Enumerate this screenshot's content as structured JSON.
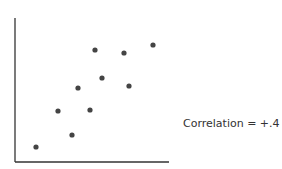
{
  "chart_data": {
    "type": "scatter",
    "title": "",
    "xlabel": "",
    "ylabel": "",
    "grid": false,
    "annotation": "Correlation = +.4",
    "points": [
      {
        "x": 21,
        "y": 15
      },
      {
        "x": 43,
        "y": 51
      },
      {
        "x": 57,
        "y": 27
      },
      {
        "x": 63,
        "y": 74
      },
      {
        "x": 75,
        "y": 52
      },
      {
        "x": 80,
        "y": 112
      },
      {
        "x": 87,
        "y": 84
      },
      {
        "x": 109,
        "y": 109
      },
      {
        "x": 114,
        "y": 76
      },
      {
        "x": 138,
        "y": 117
      }
    ],
    "xlim": [
      0,
      154
    ],
    "ylim": [
      0,
      144
    ]
  },
  "colors": {
    "axis": "#333333",
    "point": "#444444"
  }
}
